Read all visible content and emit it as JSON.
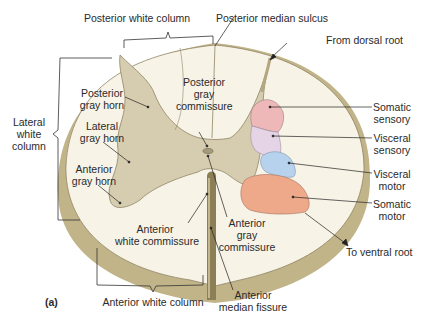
{
  "figure": {
    "panel_label": "(a)",
    "colors": {
      "white_matter": "#f7f3e6",
      "gray_matter": "#d6ccb0",
      "outer_rim": "#c2b489",
      "somatic_sensory": "#eeb7b8",
      "visceral_sensory": "#e4d4e6",
      "visceral_motor": "#b7d2ec",
      "somatic_motor": "#eea98b",
      "central_canal": "#a59a7e",
      "leader_lines": "#222222"
    }
  },
  "labels": {
    "posterior_white_column": "Posterior white column",
    "posterior_median_sulcus": "Posterior median sulcus",
    "from_dorsal_root": "From dorsal root",
    "lateral_white_column": [
      "Lateral",
      "white",
      "column"
    ],
    "posterior_gray_horn": [
      "Posterior",
      "gray horn"
    ],
    "lateral_gray_horn": [
      "Lateral",
      "gray horn"
    ],
    "anterior_gray_horn": [
      "Anterior",
      "gray horn"
    ],
    "posterior_gray_commissure": [
      "Posterior",
      "gray",
      "commissure"
    ],
    "somatic_sensory": [
      "Somatic",
      "sensory"
    ],
    "visceral_sensory": [
      "Visceral",
      "sensory"
    ],
    "visceral_motor": [
      "Visceral",
      "motor"
    ],
    "somatic_motor": [
      "Somatic",
      "motor"
    ],
    "anterior_white_commissure": [
      "Anterior",
      "white commissure"
    ],
    "anterior_gray_commissure": [
      "Anterior",
      "gray",
      "commissure"
    ],
    "to_ventral_root": "To ventral root",
    "anterior_white_column": "Anterior white column",
    "anterior_median_fissure": [
      "Anterior",
      "median fissure"
    ]
  }
}
